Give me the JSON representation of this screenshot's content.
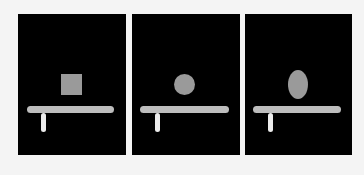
{
  "figure": {
    "background_color": "#f4f4f4",
    "panel_color": "#000000",
    "bar_color": "#bdbdbd",
    "post_color": "#ececec",
    "object_color": "#9a9a9a",
    "panels": [
      {
        "id": "panel-1",
        "object_shape": "square",
        "object_label": "square object resting above bar",
        "left": 18,
        "width": 108,
        "bar": {
          "left": 9,
          "top": 92,
          "width": 87
        },
        "post": {
          "left": 23,
          "top": 99,
          "height": 19
        },
        "object": {
          "left": 43,
          "top": 60,
          "width": 21,
          "height": 21
        }
      },
      {
        "id": "panel-2",
        "object_shape": "circle",
        "object_label": "circular object resting above bar",
        "left": 132,
        "width": 108,
        "bar": {
          "left": 8,
          "top": 92,
          "width": 89
        },
        "post": {
          "left": 23,
          "top": 99,
          "height": 19
        },
        "object": {
          "left": 42,
          "top": 60,
          "width": 21,
          "height": 21
        }
      },
      {
        "id": "panel-3",
        "object_shape": "oval",
        "object_label": "oval object resting above bar",
        "left": 245,
        "width": 107,
        "bar": {
          "left": 8,
          "top": 92,
          "width": 88
        },
        "post": {
          "left": 23,
          "top": 99,
          "height": 19
        },
        "object": {
          "left": 43,
          "top": 56,
          "width": 20,
          "height": 29
        }
      }
    ]
  }
}
